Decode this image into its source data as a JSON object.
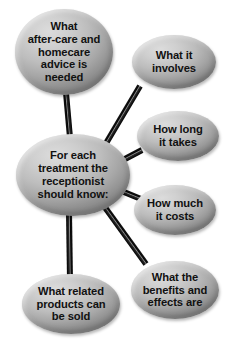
{
  "diagram": {
    "type": "mind-map",
    "background_color": "#ffffff",
    "node_fill_light": "#dcdcdc",
    "node_fill_dark": "#858585",
    "text_color": "#111111",
    "connector_color": "#0d0d0d",
    "connector_highlight_color": "#7d7d7d",
    "central_node": {
      "id": "central",
      "label": "For each\ntreatment the\nreceptionist\nshould know:",
      "cx": 73,
      "cy": 175,
      "rx": 57,
      "ry": 41
    },
    "satellite_nodes": [
      {
        "id": "after-care",
        "label": "What\nafter-care and\nhomecare\nadvice is\nneeded",
        "cx": 64,
        "cy": 52,
        "rx": 49,
        "ry": 43
      },
      {
        "id": "involves",
        "label": "What it\ninvolves",
        "cx": 174,
        "cy": 62,
        "rx": 42,
        "ry": 27
      },
      {
        "id": "how-long",
        "label": "How long\nit takes",
        "cx": 178,
        "cy": 136,
        "rx": 41,
        "ry": 25
      },
      {
        "id": "how-much",
        "label": "How much\nit costs",
        "cx": 175,
        "cy": 210,
        "rx": 41,
        "ry": 25
      },
      {
        "id": "benefits",
        "label": "What the\nbenefits and\neffects are",
        "cx": 175,
        "cy": 290,
        "rx": 44,
        "ry": 29
      },
      {
        "id": "related-products",
        "label": "What related\nproducts can\nbe sold",
        "cx": 71,
        "cy": 304,
        "rx": 49,
        "ry": 30
      }
    ],
    "connectors": [
      {
        "id": "central-to-after-care",
        "x1": 70,
        "y1": 138,
        "x2": 66,
        "y2": 93,
        "width": 6
      },
      {
        "id": "central-to-involves",
        "x1": 102,
        "y1": 150,
        "x2": 140,
        "y2": 86,
        "width": 6
      },
      {
        "id": "central-to-how-long",
        "x1": 123,
        "y1": 160,
        "x2": 142,
        "y2": 150,
        "width": 6
      },
      {
        "id": "central-to-how-much",
        "x1": 124,
        "y1": 192,
        "x2": 141,
        "y2": 199,
        "width": 6
      },
      {
        "id": "central-to-benefits",
        "x1": 104,
        "y1": 206,
        "x2": 146,
        "y2": 264,
        "width": 6
      },
      {
        "id": "central-to-related-products",
        "x1": 69,
        "y1": 211,
        "x2": 70,
        "y2": 280,
        "width": 6
      }
    ],
    "caption": {
      "partial_text": ""
    }
  }
}
